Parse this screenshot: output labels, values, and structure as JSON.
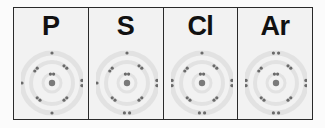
{
  "elements": [
    {
      "symbol": "P",
      "shells": [
        2,
        8,
        5
      ]
    },
    {
      "symbol": "S",
      "shells": [
        2,
        8,
        6
      ]
    },
    {
      "symbol": "Cl",
      "shells": [
        2,
        8,
        7
      ]
    },
    {
      "symbol": "Ar",
      "shells": [
        2,
        8,
        8
      ]
    }
  ],
  "colors": {
    "electron": "#6a6a6a",
    "nucleus": "#7a7a7a",
    "shell_ring": "#dcdcdc",
    "border": "#2a2a2a"
  }
}
